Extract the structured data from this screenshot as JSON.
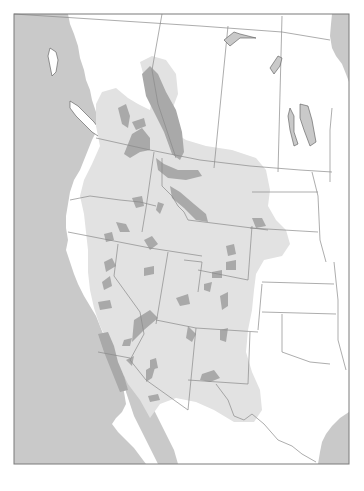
{
  "figure": {
    "type": "range-map",
    "region": "Western North America",
    "colors": {
      "ocean": "#c9c9c9",
      "land": "#ffffff",
      "range": "#e2e2e2",
      "core": "#a9a9a9",
      "border": "#8a8a8a",
      "frame": "#7a7a7a",
      "lake": "#c9c9c9"
    },
    "legend": []
  }
}
